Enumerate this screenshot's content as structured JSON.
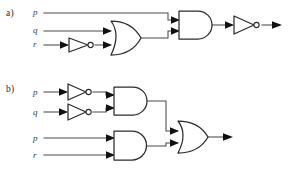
{
  "figure": {
    "background_color": "#ffffff",
    "wire_color": "#4a4a4a",
    "gate_stroke_color": "#2b2b2b",
    "arrow_color": "#111111"
  },
  "parts": [
    {
      "id": "a",
      "label": "a)",
      "expression": "NOT( p AND ( q OR NOT r ) )",
      "inputs": [
        {
          "name": "p",
          "label": "p",
          "inverted": false
        },
        {
          "name": "q",
          "label": "q",
          "inverted": false
        },
        {
          "name": "r",
          "label": "r",
          "inverted": true
        }
      ],
      "gates": [
        {
          "name": "not-r",
          "type": "NOT",
          "inputs": [
            "r"
          ]
        },
        {
          "name": "or-1",
          "type": "OR",
          "inputs": [
            "q",
            "not-r"
          ]
        },
        {
          "name": "and-1",
          "type": "AND",
          "inputs": [
            "p",
            "or-1"
          ]
        },
        {
          "name": "not-out",
          "type": "NOT",
          "inputs": [
            "and-1"
          ]
        }
      ],
      "output": {
        "name": "output",
        "label": ""
      }
    },
    {
      "id": "b",
      "label": "b)",
      "expression": "( NOT p AND NOT q ) OR ( p AND r )",
      "inputs": [
        {
          "name": "p-top",
          "label": "p",
          "inverted": true
        },
        {
          "name": "q-top",
          "label": "q",
          "inverted": true
        },
        {
          "name": "p-bottom",
          "label": "p",
          "inverted": false
        },
        {
          "name": "r-bottom",
          "label": "r",
          "inverted": false
        }
      ],
      "gates": [
        {
          "name": "not-p",
          "type": "NOT",
          "inputs": [
            "p-top"
          ]
        },
        {
          "name": "not-q",
          "type": "NOT",
          "inputs": [
            "q-top"
          ]
        },
        {
          "name": "and-top",
          "type": "AND",
          "inputs": [
            "not-p",
            "not-q"
          ]
        },
        {
          "name": "and-bottom",
          "type": "AND",
          "inputs": [
            "p-bottom",
            "r-bottom"
          ]
        },
        {
          "name": "or-out",
          "type": "OR",
          "inputs": [
            "and-top",
            "and-bottom"
          ]
        }
      ],
      "output": {
        "name": "output",
        "label": ""
      }
    }
  ],
  "labels": {
    "part_a": "a)",
    "part_b": "b)",
    "a_p": "p",
    "a_q": "q",
    "a_r": "r",
    "b_p_top": "p",
    "b_q_top": "q",
    "b_p_bottom": "p",
    "b_r_bottom": "r"
  }
}
